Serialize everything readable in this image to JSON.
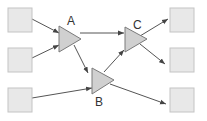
{
  "diagram": {
    "nodes": [
      {
        "id": "in1",
        "type": "box",
        "x": 8,
        "y": 8,
        "w": 24,
        "h": 24
      },
      {
        "id": "in2",
        "type": "box",
        "x": 8,
        "y": 48,
        "w": 24,
        "h": 24
      },
      {
        "id": "in3",
        "type": "box",
        "x": 8,
        "y": 88,
        "w": 24,
        "h": 24
      },
      {
        "id": "out1",
        "type": "box",
        "x": 170,
        "y": 8,
        "w": 24,
        "h": 24
      },
      {
        "id": "out2",
        "type": "box",
        "x": 170,
        "y": 48,
        "w": 24,
        "h": 24
      },
      {
        "id": "out3",
        "type": "box",
        "x": 170,
        "y": 88,
        "w": 24,
        "h": 24
      },
      {
        "id": "A",
        "type": "triangle",
        "label": "A"
      },
      {
        "id": "B",
        "type": "triangle",
        "label": "B"
      },
      {
        "id": "C",
        "type": "triangle",
        "label": "C"
      }
    ],
    "labels": {
      "A": "A",
      "B": "B",
      "C": "C"
    },
    "edges": [
      {
        "from": "in1",
        "to": "A"
      },
      {
        "from": "in2",
        "to": "A"
      },
      {
        "from": "in3",
        "to": "B"
      },
      {
        "from": "A",
        "to": "C"
      },
      {
        "from": "A",
        "to": "B"
      },
      {
        "from": "B",
        "to": "C"
      },
      {
        "from": "C",
        "to": "out1"
      },
      {
        "from": "C",
        "to": "out2"
      },
      {
        "from": "B",
        "to": "out3"
      }
    ],
    "colors": {
      "box_fill": "#e8e8e8",
      "triangle_fill": "#d0d0d0",
      "edge": "#555555"
    }
  }
}
